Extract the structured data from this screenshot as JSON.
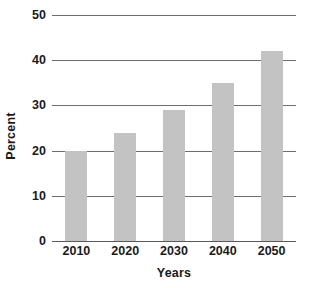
{
  "chart_data": {
    "type": "bar",
    "title": "",
    "subtitle": "",
    "xlabel": "Years",
    "ylabel": "Percent",
    "categories": [
      "2010",
      "2020",
      "2030",
      "2040",
      "2050"
    ],
    "values": [
      20,
      24,
      29,
      35,
      42
    ],
    "series": [
      {
        "name": "Percent",
        "values": [
          20,
          24,
          29,
          35,
          42
        ]
      }
    ],
    "ylim": [
      0,
      50
    ],
    "yticks": [
      0,
      10,
      20,
      30,
      40,
      50
    ],
    "ytick_labels": [
      "0",
      "10",
      "20",
      "30",
      "40",
      "50"
    ],
    "xtick_labels": [
      "2010",
      "2020",
      "2030",
      "2040",
      "2050"
    ],
    "grid": true,
    "grid_axis": "y",
    "legend": false,
    "legend_position": "none",
    "annotations": [],
    "colors": {
      "bar_fill": "#c3c3c3",
      "gridline": "#6e6e6e",
      "axis": "#5a5a5a",
      "text": "#1a1a1a",
      "background": "#ffffff"
    }
  }
}
